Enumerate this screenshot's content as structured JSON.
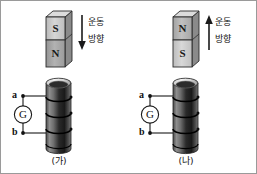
{
  "figure": {
    "background_color": "#ffffff",
    "border_color": "#9a9a9a"
  },
  "panels": [
    {
      "id": "ga",
      "caption": "(가)",
      "magnet": {
        "top_pole": "S",
        "bottom_pole": "N",
        "top_face_color": "#cfcfcf",
        "bottom_face_color": "#a8a8a8",
        "side_color": "#8f8f8f",
        "cap_color": "#d8d8d8",
        "outline_color": "#2b2b2b"
      },
      "motion": {
        "label_line1": "운동",
        "label_line2": "방향",
        "arrow_direction": "down",
        "arrow_color": "#1a1a1a"
      },
      "coil": {
        "body_color_dark": "#1b1b1b",
        "body_color_light": "#8c8c8c",
        "rim_color": "#efefef",
        "turns": 4
      },
      "circuit": {
        "terminal_top": "a",
        "terminal_bottom": "b",
        "meter": "G",
        "wire_color": "#1a1a1a"
      }
    },
    {
      "id": "na",
      "caption": "(나)",
      "magnet": {
        "top_pole": "N",
        "bottom_pole": "S",
        "top_face_color": "#b6b6b6",
        "bottom_face_color": "#cfcfcf",
        "side_color": "#8f8f8f",
        "cap_color": "#d8d8d8",
        "outline_color": "#2b2b2b"
      },
      "motion": {
        "label_line1": "운동",
        "label_line2": "방향",
        "arrow_direction": "up",
        "arrow_color": "#1a1a1a"
      },
      "coil": {
        "body_color_dark": "#1b1b1b",
        "body_color_light": "#8c8c8c",
        "rim_color": "#efefef",
        "turns": 4
      },
      "circuit": {
        "terminal_top": "a",
        "terminal_bottom": "b",
        "meter": "G",
        "wire_color": "#1a1a1a"
      }
    }
  ]
}
